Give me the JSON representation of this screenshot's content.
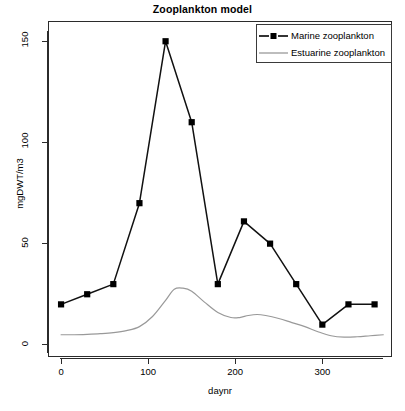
{
  "chart_data": {
    "type": "line",
    "title": "Zooplankton model",
    "xlabel": "daynr",
    "ylabel": "mgDWT/m3",
    "xlim": [
      -15,
      380
    ],
    "ylim": [
      -6,
      160
    ],
    "xticks": [
      0,
      100,
      200,
      300
    ],
    "yticks": [
      0,
      50,
      100,
      150
    ],
    "xtick_labels": [
      "0",
      "100",
      "200",
      "300"
    ],
    "ytick_labels": [
      "0",
      "50",
      "100",
      "150"
    ],
    "grid": false,
    "legend_position": "top-right",
    "series": [
      {
        "name": "Marine zooplankton",
        "color": "#000000",
        "marker": "square",
        "linestyle": "solid",
        "x": [
          0,
          30,
          60,
          90,
          120,
          150,
          180,
          210,
          240,
          270,
          300,
          330,
          360
        ],
        "values": [
          20,
          25,
          30,
          70,
          150,
          110,
          30,
          61,
          50,
          30,
          10,
          20,
          20
        ]
      },
      {
        "name": "Estuarine zooplankton",
        "color": "#999999",
        "marker": "none",
        "linestyle": "solid",
        "x": [
          0,
          15,
          30,
          45,
          60,
          75,
          90,
          105,
          120,
          130,
          140,
          150,
          165,
          180,
          195,
          205,
          215,
          225,
          235,
          250,
          265,
          280,
          295,
          310,
          325,
          340,
          355,
          370
        ],
        "values": [
          5,
          5,
          5.2,
          5.5,
          6,
          7,
          9,
          14,
          22,
          27.5,
          28,
          26.5,
          21,
          16,
          13.5,
          13.5,
          14.5,
          15,
          14.5,
          13,
          11,
          9,
          6.5,
          4.5,
          3.8,
          4,
          4.5,
          5
        ]
      }
    ]
  },
  "legend": {
    "items": [
      {
        "label": "Marine zooplankton",
        "key": "line-with-square-marker",
        "color": "#000000"
      },
      {
        "label": "Estuarine zooplankton",
        "key": "plain-line",
        "color": "#999999"
      }
    ]
  }
}
